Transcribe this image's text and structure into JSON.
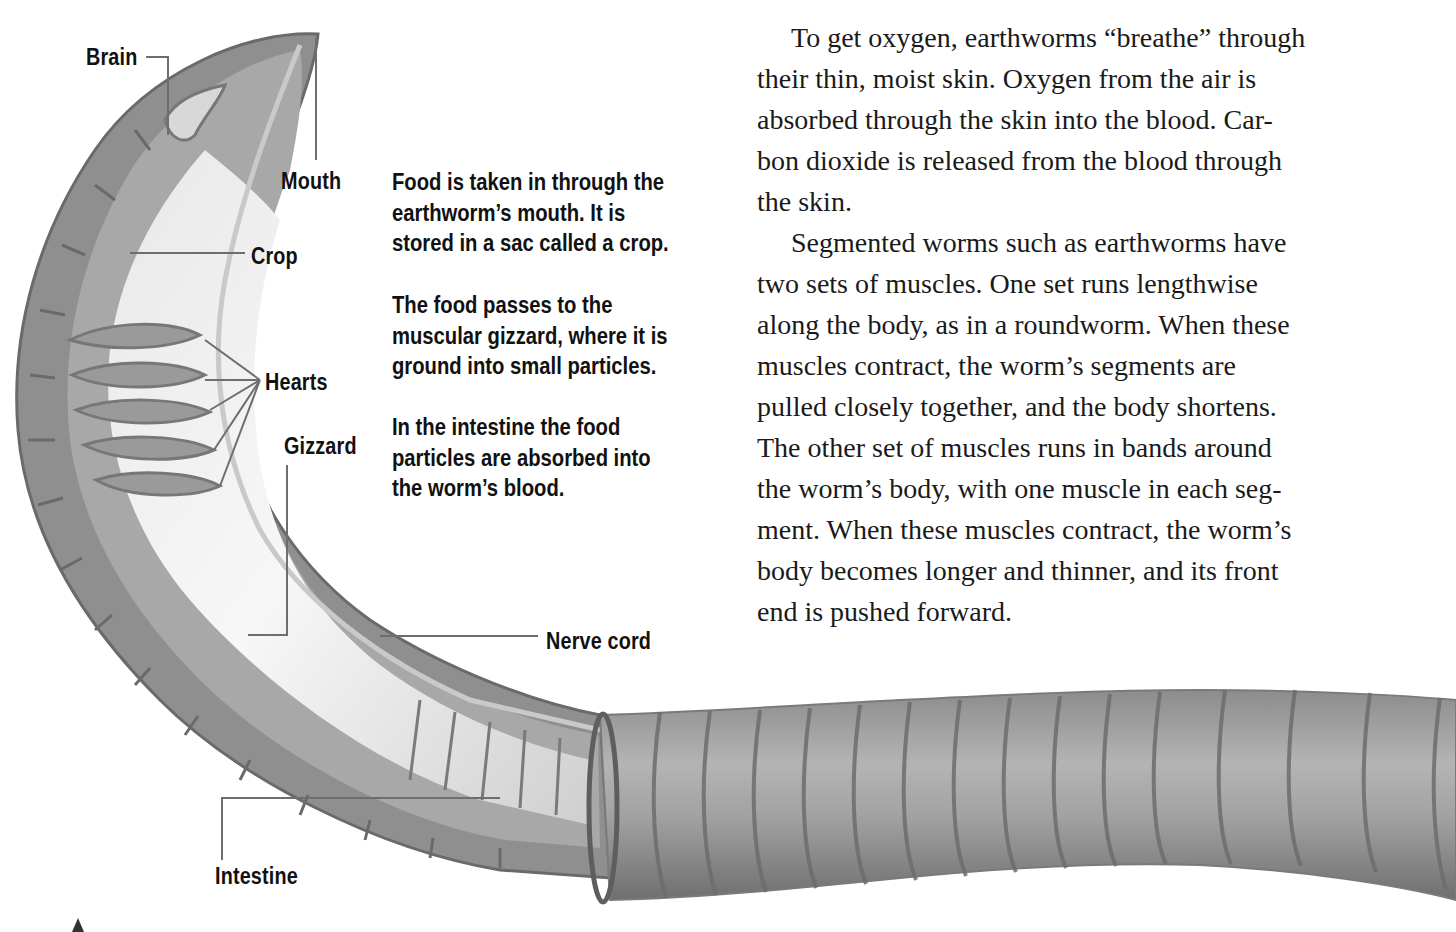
{
  "diagram": {
    "labels": {
      "brain": "Brain",
      "mouth": "Mouth",
      "crop": "Crop",
      "hearts": "Hearts",
      "gizzard": "Gizzard",
      "nerve_cord": "Nerve cord",
      "intestine": "Intestine"
    },
    "colors": {
      "worm_dark": "#7a7a7a",
      "worm_mid": "#9e9e9e",
      "worm_light": "#d6d6d6",
      "gut_highlight": "#f2f2f2",
      "leader_line": "#6e6e6e"
    }
  },
  "captions": [
    {
      "lines": [
        "Food is taken in through the",
        "earthworm’s mouth. It is",
        "stored in a sac called a crop."
      ]
    },
    {
      "lines": [
        "The food passes to the",
        "muscular gizzard, where it is",
        "ground into small particles."
      ]
    },
    {
      "lines": [
        "In the intestine the food",
        "particles are absorbed into",
        "the worm’s blood."
      ]
    }
  ],
  "body_text": {
    "paragraphs": [
      {
        "lines": [
          "To get oxygen, earthworms “breathe” through",
          "their thin, moist skin. Oxygen from the air is",
          "absorbed through the skin into the blood. Car-",
          "bon dioxide is released from the blood through",
          "the skin."
        ]
      },
      {
        "lines": [
          "Segmented worms such as earthworms have",
          "two sets of muscles. One set runs lengthwise",
          "along the body, as in a roundworm. When these",
          "muscles contract, the worm’s segments are",
          "pulled closely together, and the body shortens.",
          "The other set of muscles runs in bands around",
          "the worm’s body, with one muscle in each seg-",
          "ment. When these muscles contract, the worm’s",
          "body becomes longer and thinner, and its front",
          "end is pushed forward."
        ]
      }
    ]
  }
}
